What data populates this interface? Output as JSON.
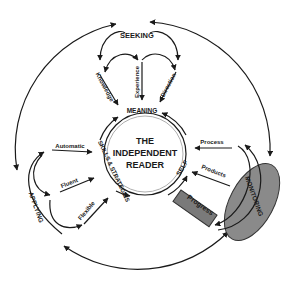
{
  "center": {
    "line1": "THE",
    "line2": "INDEPENDENT",
    "line3": "READER"
  },
  "inner_ring": {
    "top": "MEANING",
    "right": "SELF",
    "left": "SKILLS & STRATEGIES"
  },
  "seeking": {
    "title": "SEEKING",
    "items": [
      "Knowledge",
      "Experience",
      "Direction"
    ]
  },
  "applying": {
    "title": "APPLYING",
    "items": [
      "Automatic",
      "Fluent",
      "Flexible"
    ]
  },
  "monitoring": {
    "title": "MONITORING",
    "items": [
      "Process",
      "Products"
    ],
    "box": "Progress"
  },
  "colors": {
    "ink": "#1a1a1a",
    "monitoring_fill": "#8a8a8a",
    "progress_fill": "#7a7a7a"
  }
}
